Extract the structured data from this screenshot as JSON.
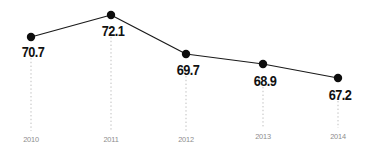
{
  "chart_data": {
    "type": "line",
    "title": "",
    "subtitle": "",
    "xlabel": "",
    "ylabel": "",
    "grid": false,
    "legend": false,
    "categories": [
      "2010",
      "2011",
      "2012",
      "2013",
      "2014"
    ],
    "values": [
      70.7,
      72.1,
      69.7,
      68.9,
      67.2
    ],
    "value_labels": [
      "70.7",
      "72.1",
      "69.7",
      "68.9",
      "67.2"
    ],
    "tick_labels": [
      "2010",
      "2011",
      "2012",
      "2013",
      "2014"
    ],
    "ylim": [
      66.0,
      73.0
    ],
    "series": [
      {
        "name": "",
        "values": [
          70.7,
          72.1,
          69.7,
          68.9,
          67.2
        ]
      }
    ],
    "colors": {
      "line": "#1a1a1a",
      "marker": "#0d0d0d",
      "value_text": "#111111",
      "tick_text": "#8d8d8d",
      "leader_line": "#b8b8b8",
      "background": "#ffffff"
    },
    "points": [
      {
        "category": "2010",
        "value": 70.7,
        "label": "70.7",
        "x": 31,
        "y": 37,
        "label_x": 33,
        "label_y": 45,
        "leader_top": 58,
        "leader_bottom": 131,
        "tick_x": 31,
        "tick_y": 136
      },
      {
        "category": "2011",
        "value": 72.1,
        "label": "72.1",
        "x": 111,
        "y": 15,
        "label_x": 113,
        "label_y": 24,
        "leader_top": 37,
        "leader_bottom": 131,
        "tick_x": 111,
        "tick_y": 136
      },
      {
        "category": "2012",
        "value": 69.7,
        "label": "69.7",
        "x": 186,
        "y": 54,
        "label_x": 188,
        "label_y": 63,
        "leader_top": 76,
        "leader_bottom": 131,
        "tick_x": 186,
        "tick_y": 136
      },
      {
        "category": "2013",
        "value": 68.9,
        "label": "68.9",
        "x": 263,
        "y": 64,
        "label_x": 265,
        "label_y": 74,
        "leader_top": 87,
        "leader_bottom": 128,
        "tick_x": 263,
        "tick_y": 133
      },
      {
        "category": "2014",
        "value": 67.2,
        "label": "67.2",
        "x": 338,
        "y": 78,
        "label_x": 340,
        "label_y": 88,
        "leader_top": 101,
        "leader_bottom": 128,
        "tick_x": 338,
        "tick_y": 133
      }
    ]
  }
}
